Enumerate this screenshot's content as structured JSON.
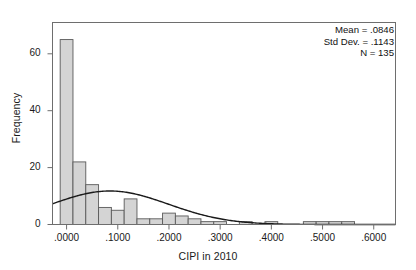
{
  "chart_data": {
    "type": "bar",
    "title": "",
    "subtitle": "",
    "xlabel": "CIPI in 2010",
    "ylabel": "Frequency",
    "xlim": [
      -0.0275,
      0.6425
    ],
    "ylim": [
      0,
      71
    ],
    "grid": false,
    "legend": null,
    "bin_width": 0.025,
    "categories": [
      "-.0125 to .0125",
      ".0125 to .0375",
      ".0375 to .0625",
      ".0625 to .0875",
      ".0875 to .1125",
      ".1125 to .1375",
      ".1375 to .1625",
      ".1625 to .1875",
      ".1875 to .2125",
      ".2125 to .2375",
      ".2375 to .2625",
      ".2625 to .2875",
      ".2875 to .3125",
      ".3125 to .3375",
      ".3375 to .3625",
      ".3625 to .3875",
      ".3875 to .4125",
      ".4125 to .4375",
      ".4375 to .4625",
      ".4625 to .4875",
      ".4875 to .5125",
      ".5125 to .5375",
      ".5375 to .5625"
    ],
    "bin_centers": [
      0.0,
      0.025,
      0.05,
      0.075,
      0.1,
      0.125,
      0.15,
      0.175,
      0.2,
      0.225,
      0.25,
      0.275,
      0.3,
      0.325,
      0.35,
      0.375,
      0.4,
      0.425,
      0.45,
      0.475,
      0.5,
      0.525,
      0.55
    ],
    "values": [
      65,
      22,
      14,
      6,
      5,
      9,
      2,
      2,
      4,
      3,
      2,
      1,
      1,
      0,
      1,
      0,
      1,
      0,
      0,
      1,
      1,
      1,
      1
    ],
    "xticks": [
      0.0,
      0.1,
      0.2,
      0.3,
      0.4,
      0.5,
      0.6
    ],
    "xticklabels": [
      ".0000",
      ".1000",
      ".2000",
      ".3000",
      ".4000",
      ".5000",
      ".6000"
    ],
    "yticks": [
      0,
      20,
      40,
      60
    ],
    "yticklabels": [
      "0",
      "20",
      "40",
      "60"
    ],
    "overlay_curve": {
      "name": "normal",
      "mean": 0.0846,
      "std_dev": 0.1143,
      "n": 135,
      "peak_frequency": 15.2
    },
    "annotations": {
      "mean_label": "Mean = .0846",
      "std_dev_label": "Std Dev. = .1143",
      "n_label": "N = 135"
    },
    "colors": {
      "bar_fill": "#d4d4d4",
      "bar_edge": "#5a5a5a",
      "curve": "#1a1a1a",
      "axis": "#6e6e6e",
      "text": "#1a1a1a",
      "background": "#ffffff"
    }
  }
}
